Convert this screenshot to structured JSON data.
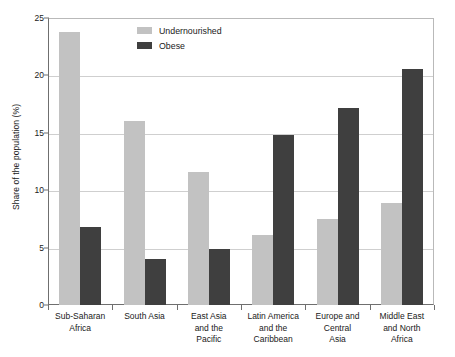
{
  "chart_data": {
    "type": "bar",
    "title": "",
    "xlabel": "",
    "ylabel": "Share of the population (%)",
    "ylim": [
      0,
      25
    ],
    "yticks": [
      "0",
      "5",
      "10",
      "15",
      "20",
      "25"
    ],
    "grid": true,
    "legend_position": "top-left-inside",
    "categories": [
      "Sub-Saharan Africa",
      "South Asia",
      "East Asia and the Pacific",
      "Latin America and the Caribbean",
      "Europe and Central Asia",
      "Middle East and North Africa"
    ],
    "category_lines": [
      [
        "Sub-Saharan",
        "Africa"
      ],
      [
        "South Asia"
      ],
      [
        "East Asia",
        "and the",
        "Pacific"
      ],
      [
        "Latin America",
        "and the",
        "Caribbean"
      ],
      [
        "Europe and",
        "Central",
        "Asia"
      ],
      [
        "Middle East",
        "and North",
        "Africa"
      ]
    ],
    "series": [
      {
        "name": "Undernourished",
        "color": "#c2c2c2",
        "values": [
          23.8,
          16.0,
          11.6,
          6.1,
          7.5,
          8.85
        ]
      },
      {
        "name": "Obese",
        "color": "#3f3f3f",
        "values": [
          6.8,
          4.0,
          4.9,
          14.8,
          17.2,
          20.55
        ]
      }
    ]
  },
  "legend": {
    "items": [
      {
        "label": "Undernourished"
      },
      {
        "label": "Obese"
      }
    ]
  },
  "axis": {
    "y_title": "Share of the population (%)"
  }
}
